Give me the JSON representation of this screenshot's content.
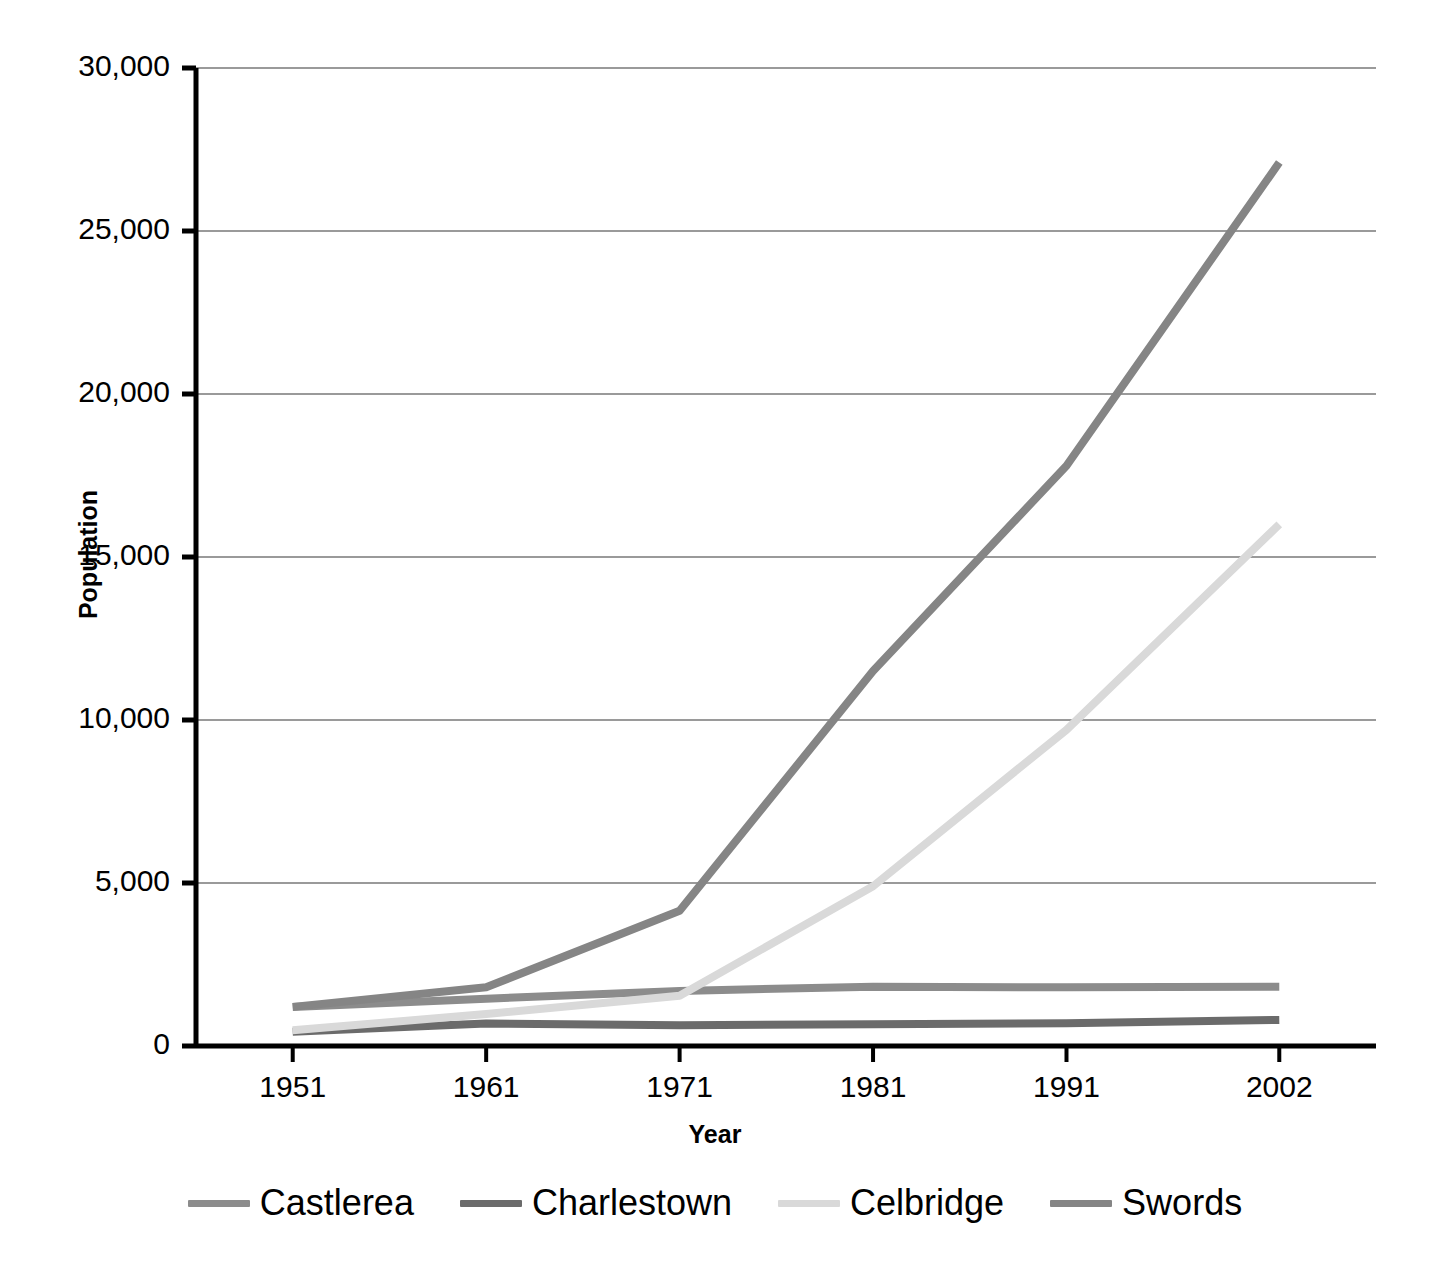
{
  "chart_data": {
    "type": "line",
    "title": "",
    "xlabel": "Year",
    "ylabel": "Population",
    "categories": [
      "1951",
      "1961",
      "1971",
      "1981",
      "1991",
      "2002"
    ],
    "x": [
      1951,
      1961,
      1971,
      1981,
      1991,
      2002
    ],
    "xlim": [
      1946,
      2007
    ],
    "ylim": [
      0,
      30000
    ],
    "yticks": [
      0,
      5000,
      10000,
      15000,
      20000,
      25000,
      30000
    ],
    "ytick_labels": [
      "0",
      "5,000",
      "10,000",
      "15,000",
      "20,000",
      "25,000",
      "30,000"
    ],
    "grid": "horizontal",
    "legend_position": "bottom",
    "series": [
      {
        "name": "Castlerea",
        "color": "#8c8c8c",
        "values": [
          1200,
          1450,
          1690,
          1820,
          1800,
          1815
        ]
      },
      {
        "name": "Charlestown",
        "color": "#6b6b6b",
        "values": [
          440,
          690,
          640,
          670,
          700,
          800
        ]
      },
      {
        "name": "Celbridge",
        "color": "#d9d9d9",
        "values": [
          480,
          980,
          1540,
          4900,
          9700,
          16000
        ]
      },
      {
        "name": "Swords",
        "color": "#858585",
        "values": [
          1200,
          1800,
          4150,
          11500,
          17800,
          27100
        ]
      }
    ]
  },
  "axes": {
    "y_title": "Population",
    "x_title": "Year"
  },
  "legend": {
    "items": [
      {
        "label": "Castlerea",
        "color": "#8c8c8c"
      },
      {
        "label": "Charlestown",
        "color": "#6b6b6b"
      },
      {
        "label": "Celbridge",
        "color": "#d9d9d9"
      },
      {
        "label": "Swords",
        "color": "#858585"
      }
    ]
  },
  "style": {
    "axis_color": "#000000",
    "grid_color": "#9a9a9a",
    "background": "#ffffff"
  }
}
